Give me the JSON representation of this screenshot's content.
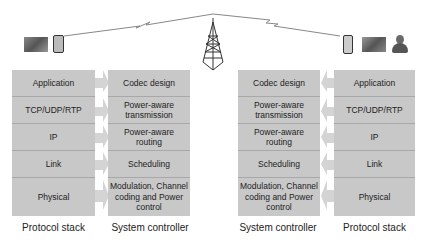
{
  "diagram": {
    "left": {
      "protocol_stack": [
        "Application",
        "TCP/UDP/RTP",
        "IP",
        "Link",
        "Physical"
      ],
      "system_controller": [
        "Codec design",
        "Power-aware transmission",
        "Power-aware routing",
        "Scheduling",
        "Modulation, Channel coding and Power control"
      ],
      "caption_stack": "Protocol stack",
      "caption_controller": "System controller",
      "icons": [
        "video-thumbnail-icon",
        "cell-phone-icon"
      ]
    },
    "right": {
      "system_controller": [
        "Codec design",
        "Power-aware transmission",
        "Power-aware routing",
        "Scheduling",
        "Modulation, Channel coding and Power control"
      ],
      "protocol_stack": [
        "Application",
        "TCP/UDP/RTP",
        "IP",
        "Link",
        "Physical"
      ],
      "caption_controller": "System controller",
      "caption_stack": "Protocol stack",
      "icons": [
        "pda-icon",
        "video-thumbnail-icon",
        "user-icon"
      ]
    },
    "center_icon": "radio-tower-icon",
    "colors": {
      "box": "#c8c8c8",
      "divider": "#a8a8a8",
      "arrow": "#d4d4d4",
      "text": "#222222"
    }
  }
}
